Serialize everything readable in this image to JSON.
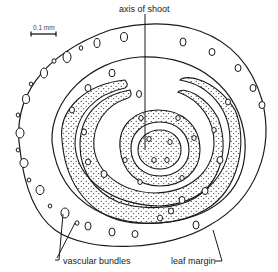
{
  "diagram": {
    "type": "botanical-cross-section",
    "colors": {
      "stroke": "#1a1a1a",
      "background": "#ffffff"
    }
  },
  "labels": {
    "scale_bar": "0.1 mm",
    "axis": "axis of shoot",
    "vascular": "vascular bundles",
    "margin": "leaf margin"
  }
}
